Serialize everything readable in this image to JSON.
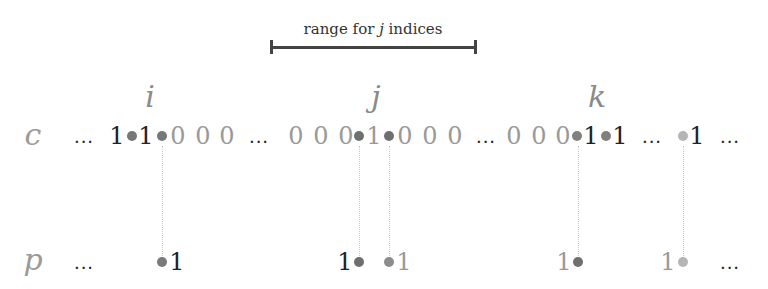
{
  "range": {
    "label_prefix": "range for ",
    "label_var": "j",
    "label_suffix": " indices",
    "x_start": 271,
    "x_end": 476
  },
  "indices": [
    {
      "name": "i",
      "x": 150
    },
    {
      "name": "j",
      "x": 376
    },
    {
      "name": "k",
      "x": 597
    }
  ],
  "rows": {
    "c": {
      "label": "c",
      "tokens": [
        {
          "t": "...",
          "x": 84,
          "kind": "ellipsis"
        },
        {
          "t": "1",
          "x": 117,
          "kind": "dark"
        },
        {
          "t": "1",
          "x": 146,
          "kind": "dark"
        },
        {
          "t": "0",
          "x": 178,
          "kind": "grey"
        },
        {
          "t": "0",
          "x": 203,
          "kind": "grey"
        },
        {
          "t": "0",
          "x": 227,
          "kind": "grey"
        },
        {
          "t": "...",
          "x": 259,
          "kind": "ellipsis"
        },
        {
          "t": "0",
          "x": 296,
          "kind": "grey"
        },
        {
          "t": "0",
          "x": 321,
          "kind": "grey"
        },
        {
          "t": "0",
          "x": 346,
          "kind": "grey"
        },
        {
          "t": "1",
          "x": 374,
          "kind": "grey"
        },
        {
          "t": "0",
          "x": 405,
          "kind": "grey"
        },
        {
          "t": "0",
          "x": 430,
          "kind": "grey"
        },
        {
          "t": "0",
          "x": 455,
          "kind": "grey"
        },
        {
          "t": "...",
          "x": 486,
          "kind": "ellipsis"
        },
        {
          "t": "0",
          "x": 514,
          "kind": "grey"
        },
        {
          "t": "0",
          "x": 539,
          "kind": "grey"
        },
        {
          "t": "0",
          "x": 563,
          "kind": "grey"
        },
        {
          "t": "1",
          "x": 591,
          "kind": "dark"
        },
        {
          "t": "1",
          "x": 620,
          "kind": "dark"
        },
        {
          "t": "...",
          "x": 652,
          "kind": "ellipsis"
        },
        {
          "t": "1",
          "x": 697,
          "kind": "dark"
        },
        {
          "t": "...",
          "x": 730,
          "kind": "ellipsis"
        }
      ],
      "dots": [
        {
          "x": 132,
          "color": "#777777"
        },
        {
          "x": 162,
          "color": "#777777"
        },
        {
          "x": 359,
          "color": "#6f6f6f"
        },
        {
          "x": 389,
          "color": "#6f6f6f"
        },
        {
          "x": 577,
          "color": "#808080"
        },
        {
          "x": 606,
          "color": "#808080"
        },
        {
          "x": 683,
          "color": "#b5b5b5"
        }
      ]
    },
    "p": {
      "label": "p",
      "tokens": [
        {
          "t": "...",
          "x": 84,
          "kind": "ellipsis"
        },
        {
          "t": "1",
          "x": 177,
          "kind": "dark"
        },
        {
          "t": "1",
          "x": 345,
          "kind": "dark"
        },
        {
          "t": "1",
          "x": 404,
          "kind": "grey"
        },
        {
          "t": "1",
          "x": 564,
          "kind": "grey"
        },
        {
          "t": "1",
          "x": 668,
          "kind": "grey"
        },
        {
          "t": "...",
          "x": 730,
          "kind": "ellipsis"
        }
      ],
      "dots": [
        {
          "x": 162,
          "color": "#7a7a7a"
        },
        {
          "x": 359,
          "color": "#6f6f6f"
        },
        {
          "x": 389,
          "color": "#8c8c8c"
        },
        {
          "x": 578,
          "color": "#6f6f6f"
        },
        {
          "x": 683,
          "color": "#b5b5b5"
        }
      ]
    }
  },
  "links": [
    162,
    359,
    389,
    578,
    683
  ]
}
